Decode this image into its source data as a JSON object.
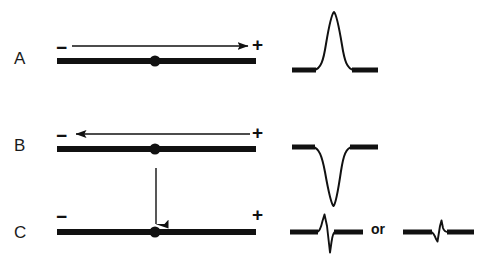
{
  "figure": {
    "background_color": "#ffffff",
    "ink_color": "#111111",
    "width": 478,
    "height": 262
  },
  "rows": [
    {
      "label": "A",
      "label_x": 14,
      "label_y": 50,
      "minus_sign": "−",
      "minus_x": 56,
      "minus_y": 38,
      "plus_sign": "+",
      "plus_x": 252,
      "plus_y": 37,
      "arrow_direction": "right",
      "arrow_x1": 72,
      "arrow_x2": 250,
      "arrow_y": 46,
      "fiber_x1": 57,
      "fiber_x2": 256,
      "fiber_y": 61,
      "electrode_dot_x": 155,
      "electrode_dot_y": 61,
      "trace_name": "monophasic-positive",
      "trace_description": "upward positive spike on flat baseline"
    },
    {
      "label": "B",
      "label_x": 14,
      "label_y": 137,
      "minus_sign": "−",
      "minus_x": 56,
      "minus_y": 126,
      "plus_sign": "+",
      "plus_x": 252,
      "plus_y": 124,
      "arrow_direction": "left",
      "arrow_x1": 250,
      "arrow_x2": 73,
      "arrow_y": 134,
      "fiber_x1": 57,
      "fiber_x2": 256,
      "fiber_y": 149,
      "electrode_dot_x": 155,
      "electrode_dot_y": 149,
      "trace_name": "monophasic-negative",
      "trace_description": "downward negative deflection from flat baseline"
    },
    {
      "label": "C",
      "label_x": 14,
      "label_y": 224,
      "minus_sign": "−",
      "minus_x": 56,
      "minus_y": 207,
      "plus_sign": "+",
      "plus_x": 252,
      "plus_y": 206,
      "arrow_direction": "down",
      "arrow_x": 156,
      "arrow_y1": 168,
      "arrow_y2": 229,
      "fiber_x1": 57,
      "fiber_x2": 256,
      "fiber_y": 232,
      "electrode_dot_x": 155,
      "electrode_dot_y": 232,
      "trace_name": "biphasic",
      "trace_description": "biphasic deflection, up-then-down or down-then-up"
    }
  ],
  "traces": {
    "a": {
      "name": "trace-a-positive-spike",
      "baseline_y": 70,
      "peak_y": 12,
      "peak_x": 334,
      "left_baseline_x1": 292,
      "left_baseline_x2": 318,
      "right_baseline_x1": 350,
      "right_baseline_x2": 378
    },
    "b": {
      "name": "trace-b-negative-spike",
      "baseline_y": 147,
      "trough_y": 206,
      "trough_x": 333,
      "left_baseline_x1": 292,
      "left_baseline_x2": 317,
      "right_baseline_x1": 348,
      "right_baseline_x2": 378
    },
    "c_left": {
      "name": "trace-c-biphasic-up-down",
      "baseline_y": 232,
      "peak_y": 215,
      "trough_y": 253,
      "spike_x": 325,
      "left_baseline_x1": 290,
      "left_baseline_x2": 318,
      "right_baseline_x1": 333,
      "right_baseline_x2": 363
    },
    "c_right": {
      "name": "trace-c-biphasic-down-up",
      "baseline_y": 232,
      "peak_y": 220,
      "trough_y": 241,
      "spike_x": 440,
      "left_baseline_x1": 403,
      "left_baseline_x2": 432,
      "right_baseline_x1": 447,
      "right_baseline_x2": 474
    }
  },
  "connector": {
    "or_label": "or",
    "or_x": 371,
    "or_y": 222
  },
  "styles": {
    "fiber_thickness": 6,
    "trace_baseline_thickness": 5,
    "trace_line_thickness": 1.8,
    "arrow_shaft_thickness": 1.4,
    "electrode_dot_radius": 5.5
  }
}
